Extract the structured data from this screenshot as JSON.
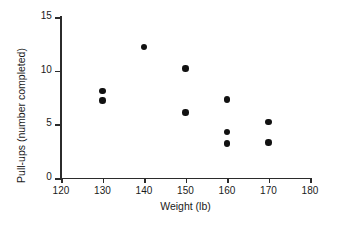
{
  "chart_data": {
    "type": "scatter",
    "title": "",
    "xlabel": "Weight (lb)",
    "ylabel": "Pull-ups (number completed)",
    "xlim": [
      120,
      180
    ],
    "ylim": [
      0,
      15
    ],
    "xticks": [
      120,
      130,
      140,
      150,
      160,
      170,
      180
    ],
    "yticks": [
      0,
      5,
      10,
      15
    ],
    "xtick_labels": [
      "120",
      "130",
      "140",
      "150",
      "160",
      "170",
      "180"
    ],
    "ytick_labels": [
      "0",
      "5",
      "10",
      "15"
    ],
    "grid": false,
    "legend": null,
    "marker_color": "#111111",
    "axis_color": "#2b2b2b",
    "background": "#ffffff",
    "x": [
      130,
      130,
      140,
      150,
      150,
      160,
      160,
      160,
      170,
      170
    ],
    "y": [
      8.1,
      7.2,
      12.2,
      10.2,
      6.1,
      7.3,
      4.3,
      3.2,
      5.2,
      3.3
    ],
    "points": [
      {
        "x": 130,
        "y": 8.1
      },
      {
        "x": 130,
        "y": 7.2
      },
      {
        "x": 140,
        "y": 12.2
      },
      {
        "x": 150,
        "y": 10.2
      },
      {
        "x": 150,
        "y": 6.1
      },
      {
        "x": 160,
        "y": 7.3
      },
      {
        "x": 160,
        "y": 4.3
      },
      {
        "x": 160,
        "y": 3.2
      },
      {
        "x": 170,
        "y": 5.2
      },
      {
        "x": 170,
        "y": 3.3
      }
    ]
  }
}
